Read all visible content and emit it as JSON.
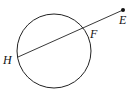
{
  "diagram": {
    "circle": {
      "cx": 54,
      "cy": 51,
      "r": 37
    },
    "points": {
      "H": {
        "label": "H",
        "x": 18,
        "y": 57
      },
      "F": {
        "label": "F",
        "x": 82,
        "y": 30
      },
      "E": {
        "label": "E",
        "x": 123,
        "y": 10
      }
    },
    "segments": [
      {
        "from": "H",
        "to": "E"
      }
    ],
    "stroke_color": "#222222"
  }
}
